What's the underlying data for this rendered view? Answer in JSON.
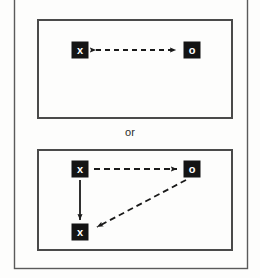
{
  "figure": {
    "type": "alternative-interaction-diagram",
    "separator_label": "or",
    "background_color": "#fdfdfc",
    "line_color": "#1a1a1a",
    "node_fill_color": "#141414",
    "node_text_color": "#ffffff",
    "panel_border_color": "#4a4a4a",
    "frame_border_color": "#5a5a5a"
  },
  "panels": [
    {
      "id": "panel-top",
      "nodes": [
        {
          "id": "top-x",
          "label": "x",
          "x": 80,
          "y": 50
        },
        {
          "id": "top-o",
          "label": "o",
          "x": 192,
          "y": 50
        }
      ],
      "edges": [
        {
          "id": "top-x-o-bidirectional",
          "from": "top-x",
          "to": "top-o",
          "style": "dashed",
          "arrowheads": "both",
          "orientation": "horizontal"
        }
      ]
    },
    {
      "id": "panel-bottom",
      "nodes": [
        {
          "id": "bottom-x-top",
          "label": "x",
          "x": 80,
          "y": 169
        },
        {
          "id": "bottom-o",
          "label": "o",
          "x": 192,
          "y": 169
        },
        {
          "id": "bottom-x-low",
          "label": "x",
          "x": 80,
          "y": 232
        }
      ],
      "edges": [
        {
          "id": "bottom-x-to-o",
          "from": "bottom-x-top",
          "to": "bottom-o",
          "style": "dashed",
          "arrowheads": "end",
          "orientation": "horizontal"
        },
        {
          "id": "bottom-x-to-x",
          "from": "bottom-x-top",
          "to": "bottom-x-low",
          "style": "solid",
          "arrowheads": "end",
          "orientation": "vertical"
        },
        {
          "id": "bottom-o-to-x",
          "from": "bottom-o",
          "to": "bottom-x-low",
          "style": "dashed",
          "arrowheads": "end",
          "orientation": "diagonal"
        }
      ]
    }
  ]
}
